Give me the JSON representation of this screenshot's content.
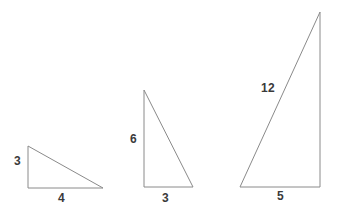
{
  "figure": {
    "type": "geometry-diagram",
    "background_color": "#ffffff",
    "stroke_color": "#8a8a8a",
    "stroke_width": 1,
    "label_color": "#3a3a3a",
    "canvas": {
      "width": 337,
      "height": 215
    },
    "shapes": [
      {
        "name": "triangle-small",
        "vertices": [
          [
            28,
            146
          ],
          [
            28,
            188
          ],
          [
            103,
            188
          ]
        ],
        "right_angle_at": [
          28,
          188
        ],
        "labels": [
          {
            "name": "vertical-leg-label",
            "text": "3",
            "x": 14,
            "y": 155
          },
          {
            "name": "horizontal-leg-label",
            "text": "4",
            "x": 58,
            "y": 192
          }
        ]
      },
      {
        "name": "triangle-medium",
        "vertices": [
          [
            144,
            90
          ],
          [
            144,
            187
          ],
          [
            193,
            187
          ]
        ],
        "right_angle_at": [
          144,
          187
        ],
        "labels": [
          {
            "name": "vertical-leg-label",
            "text": "6",
            "x": 130,
            "y": 133
          },
          {
            "name": "horizontal-leg-label",
            "text": "3",
            "x": 162,
            "y": 192
          }
        ]
      },
      {
        "name": "triangle-large",
        "vertices": [
          [
            320,
            12
          ],
          [
            240,
            187
          ],
          [
            320,
            187
          ]
        ],
        "right_angle_at": [
          320,
          187
        ],
        "labels": [
          {
            "name": "hypotenuse-label",
            "text": "12",
            "x": 261,
            "y": 82
          },
          {
            "name": "horizontal-leg-label",
            "text": "5",
            "x": 277,
            "y": 190
          }
        ]
      }
    ]
  },
  "chart_data": {
    "type": "table",
    "categories": [
      "Small triangle",
      "Medium triangle",
      "Large triangle"
    ],
    "series": [
      {
        "name": "labeled side 1",
        "values": [
          "3",
          "6",
          "12"
        ]
      },
      {
        "name": "labeled side 2",
        "values": [
          "4",
          "3",
          "5"
        ]
      }
    ]
  }
}
